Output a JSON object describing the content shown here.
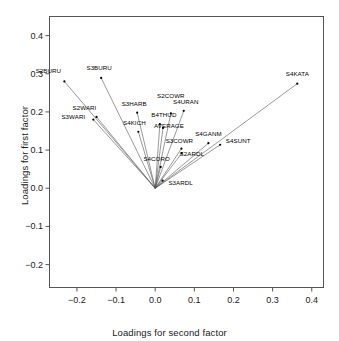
{
  "chart_data": {
    "type": "scatter",
    "title": "",
    "xlabel": "Loadings for second factor",
    "ylabel": "Loadings for first factor",
    "xlim": [
      -0.27,
      0.43
    ],
    "ylim": [
      -0.26,
      0.45
    ],
    "xticks": [
      -0.2,
      -0.1,
      0.0,
      0.1,
      0.2,
      0.3,
      0.4
    ],
    "xticklabels": [
      "-0.2",
      "-0.1",
      "0.0",
      "0.1",
      "0.2",
      "0.3",
      "0.4"
    ],
    "yticks": [
      -0.2,
      -0.1,
      0.0,
      0.1,
      0.2,
      0.3,
      0.4
    ],
    "yticklabels": [
      "-0.2",
      "-0.1",
      "0.0",
      "0.1",
      "0.2",
      "0.3",
      "0.4"
    ],
    "grid": false,
    "legend": null,
    "origin": [
      0.0,
      0.0
    ],
    "style": "rays-from-origin",
    "point_color": "#000000",
    "line_color": "#555555",
    "points": [
      {
        "label": "S2BURU",
        "x": -0.232,
        "y": 0.28,
        "label_dx": -16,
        "label_dy": -7
      },
      {
        "label": "S3BURU",
        "x": -0.138,
        "y": 0.289,
        "label_dx": -2,
        "label_dy": -7
      },
      {
        "label": "S2WARI",
        "x": -0.15,
        "y": 0.187,
        "label_dx": -12,
        "label_dy": -6
      },
      {
        "label": "S3WARI",
        "x": -0.158,
        "y": 0.18,
        "label_dx": -20,
        "label_dy": 0
      },
      {
        "label": "S3HARB",
        "x": -0.046,
        "y": 0.198,
        "label_dx": -3,
        "label_dy": -6
      },
      {
        "label": "S4KICH",
        "x": -0.043,
        "y": 0.148,
        "label_dx": -4,
        "label_dy": -6
      },
      {
        "label": "B4THUD",
        "x": 0.012,
        "y": 0.168,
        "label_dx": 4,
        "label_dy": -6
      },
      {
        "label": "AVERAGE",
        "x": 0.02,
        "y": 0.158,
        "label_dx": 6,
        "label_dy": 1
      },
      {
        "label": "S2COWR",
        "x": 0.04,
        "y": 0.196,
        "label_dx": 0,
        "label_dy": -14
      },
      {
        "label": "S4URAN",
        "x": 0.073,
        "y": 0.203,
        "label_dx": 2,
        "label_dy": -6
      },
      {
        "label": "S3COWR",
        "x": 0.067,
        "y": 0.104,
        "label_dx": -2,
        "label_dy": -5
      },
      {
        "label": "S4GANM",
        "x": 0.136,
        "y": 0.118,
        "label_dx": 0,
        "label_dy": -6
      },
      {
        "label": "S4SUNT",
        "x": 0.166,
        "y": 0.114,
        "label_dx": 18,
        "label_dy": -1
      },
      {
        "label": "S2ARDL",
        "x": 0.068,
        "y": 0.092,
        "label_dx": 10,
        "label_dy": 4
      },
      {
        "label": "S4CORO",
        "x": 0.014,
        "y": 0.056,
        "label_dx": -4,
        "label_dy": -5
      },
      {
        "label": "S3ARDL",
        "x": 0.019,
        "y": 0.02,
        "label_dx": 18,
        "label_dy": 5
      },
      {
        "label": "S4KATA",
        "x": 0.363,
        "y": 0.274,
        "label_dx": 0,
        "label_dy": -7
      }
    ]
  },
  "axes": {
    "xlabel": "Loadings for second factor",
    "ylabel": "Loadings for first factor"
  }
}
